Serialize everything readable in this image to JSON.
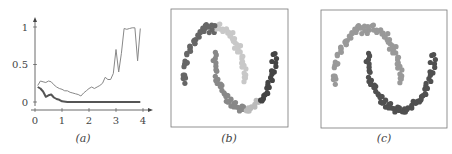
{
  "chart_data": [
    {
      "panel": "a",
      "caption": "(a)",
      "type": "line",
      "title": "",
      "xlabel": "",
      "ylabel": "",
      "xlim": [
        0,
        4.1
      ],
      "ylim": [
        -0.05,
        1.1
      ],
      "xticks": [
        0,
        1,
        2,
        3,
        4
      ],
      "yticks": [
        0,
        0.5,
        1
      ],
      "ytick_labels": [
        "0",
        "0.5",
        "1"
      ],
      "grid": false,
      "legend": null,
      "series": [
        {
          "name": "upper (thin, light gray)",
          "color": "#888888",
          "width": 1,
          "x": [
            0.1,
            0.2,
            0.3,
            0.4,
            0.5,
            0.6,
            0.7,
            0.8,
            0.9,
            1.0,
            1.1,
            1.2,
            1.3,
            1.4,
            1.5,
            1.6,
            1.7,
            1.8,
            1.9,
            2.0,
            2.1,
            2.2,
            2.3,
            2.4,
            2.5,
            2.6,
            2.7,
            2.8,
            2.9,
            3.0,
            3.1,
            3.2,
            3.3,
            3.4,
            3.5,
            3.6,
            3.7,
            3.8,
            3.9
          ],
          "y": [
            0.22,
            0.28,
            0.27,
            0.26,
            0.28,
            0.27,
            0.23,
            0.2,
            0.18,
            0.17,
            0.15,
            0.15,
            0.13,
            0.12,
            0.11,
            0.1,
            0.08,
            0.12,
            0.15,
            0.18,
            0.2,
            0.18,
            0.2,
            0.22,
            0.25,
            0.33,
            0.3,
            0.3,
            0.38,
            0.7,
            0.4,
            0.65,
            0.98,
            0.97,
            0.98,
            0.99,
            0.99,
            0.55,
            0.98
          ]
        },
        {
          "name": "lower (thick, dark gray)",
          "color": "#555555",
          "width": 2,
          "x": [
            0.1,
            0.2,
            0.3,
            0.4,
            0.5,
            0.6,
            0.7,
            0.8,
            0.9,
            1.0,
            1.2,
            1.5,
            2.0,
            2.5,
            3.0,
            3.5,
            3.9
          ],
          "y": [
            0.2,
            0.18,
            0.14,
            0.07,
            0.09,
            0.1,
            0.06,
            0.04,
            0.03,
            0.01,
            0.0,
            0.0,
            0.0,
            0.0,
            0.0,
            0.0,
            0.0
          ]
        }
      ]
    },
    {
      "panel": "b",
      "caption": "(b)",
      "type": "scatter",
      "title": "",
      "description": "Two-moons dataset colored by cluster assignment (several gray shades, mixed)",
      "grid": false,
      "frame": true,
      "series": [
        {
          "name": "dark-upper-left",
          "color": "#666666",
          "x_range": [
            -1.0,
            0.05
          ],
          "moon": "upper"
        },
        {
          "name": "light-upper-right",
          "color": "#c8c8c8",
          "x_range": [
            0.05,
            1.0
          ],
          "moon": "upper"
        },
        {
          "name": "mid-lower-left",
          "color": "#888888",
          "x_range": [
            0.0,
            1.0
          ],
          "moon": "lower-left"
        },
        {
          "name": "light-lower-bottom",
          "color": "#bbbbbb",
          "x_range": [
            1.0,
            1.5
          ],
          "moon": "lower"
        },
        {
          "name": "dark-lower-right",
          "color": "#444444",
          "x_range": [
            1.5,
            2.0
          ],
          "moon": "lower-right"
        }
      ]
    },
    {
      "panel": "c",
      "caption": "(c)",
      "type": "scatter",
      "title": "",
      "description": "Two-moons dataset correctly separated into two clusters",
      "grid": false,
      "frame": true,
      "series": [
        {
          "name": "upper moon",
          "color": "#999999",
          "moon": "upper"
        },
        {
          "name": "lower moon",
          "color": "#505050",
          "moon": "lower"
        }
      ]
    }
  ],
  "captions": {
    "a": "(a)",
    "b": "(b)",
    "c": "(c)"
  },
  "axis_a": {
    "xtick_labels": [
      "0",
      "1",
      "2",
      "3",
      "4"
    ],
    "ytick_labels": [
      "0",
      "0.5",
      "1"
    ]
  }
}
